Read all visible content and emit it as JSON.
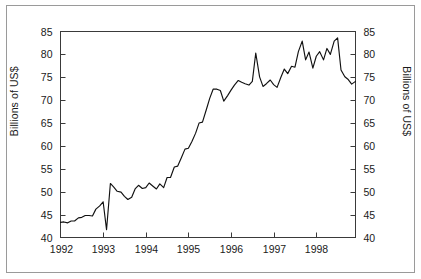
{
  "chart_data": {
    "type": "line",
    "title": "",
    "xlabel": "",
    "ylabel": "Billions of US$",
    "ylabel_right": "Billions of US$",
    "xlim": [
      1992.0,
      1998.92
    ],
    "ylim": [
      40,
      85
    ],
    "yticks": [
      40,
      45,
      50,
      55,
      60,
      65,
      70,
      75,
      80,
      85
    ],
    "xticks": [
      1992,
      1993,
      1994,
      1995,
      1996,
      1997,
      1998
    ],
    "xticklabels": [
      "1992",
      "1993",
      "1994",
      "1995",
      "1996",
      "1997",
      "1998"
    ],
    "yticklabels": [
      "40",
      "45",
      "50",
      "55",
      "60",
      "65",
      "70",
      "75",
      "80",
      "85"
    ],
    "grid": false,
    "legend": null,
    "series": [
      {
        "name": "Reserves",
        "color": "#111111",
        "x": [
          1992.0,
          1992.08,
          1992.17,
          1992.25,
          1992.33,
          1992.42,
          1992.5,
          1992.58,
          1992.67,
          1992.75,
          1992.83,
          1992.92,
          1993.0,
          1993.08,
          1993.17,
          1993.25,
          1993.33,
          1993.42,
          1993.5,
          1993.58,
          1993.67,
          1993.75,
          1993.83,
          1993.92,
          1994.0,
          1994.08,
          1994.17,
          1994.25,
          1994.33,
          1994.42,
          1994.5,
          1994.58,
          1994.67,
          1994.75,
          1994.83,
          1994.92,
          1995.0,
          1995.08,
          1995.17,
          1995.25,
          1995.33,
          1995.42,
          1995.5,
          1995.58,
          1995.67,
          1995.75,
          1995.83,
          1995.92,
          1996.0,
          1996.08,
          1996.17,
          1996.25,
          1996.33,
          1996.42,
          1996.5,
          1996.58,
          1996.67,
          1996.75,
          1996.83,
          1996.92,
          1997.0,
          1997.08,
          1997.17,
          1997.25,
          1997.33,
          1997.42,
          1997.5,
          1997.58,
          1997.67,
          1997.75,
          1997.83,
          1997.92,
          1998.0,
          1998.08,
          1998.17,
          1998.25,
          1998.33,
          1998.42,
          1998.5,
          1998.58,
          1998.67,
          1998.75,
          1998.83,
          1998.92
        ],
        "y": [
          43.3,
          43.4,
          43.2,
          43.6,
          43.6,
          44.3,
          44.4,
          44.8,
          44.8,
          44.7,
          46.2,
          46.9,
          47.8,
          41.7,
          51.8,
          51.0,
          50.1,
          49.9,
          49.0,
          48.3,
          48.8,
          50.6,
          51.4,
          50.7,
          50.9,
          51.9,
          51.2,
          50.6,
          51.7,
          50.9,
          53.1,
          53.1,
          55.4,
          55.6,
          57.3,
          59.3,
          59.5,
          60.9,
          62.8,
          65.0,
          65.2,
          67.9,
          70.4,
          72.4,
          72.4,
          72.1,
          69.8,
          71.0,
          72.2,
          73.3,
          74.3,
          73.9,
          73.6,
          73.3,
          74.1,
          80.3,
          75.1,
          73.0,
          73.6,
          74.4,
          73.4,
          72.8,
          75.0,
          76.8,
          75.8,
          77.4,
          77.2,
          80.6,
          82.9,
          78.8,
          80.5,
          77.0,
          79.6,
          80.6,
          78.8,
          81.3,
          80.0,
          82.9,
          83.6,
          76.6,
          75.1,
          74.5,
          73.5,
          74.1
        ]
      }
    ]
  },
  "axes": {
    "left_title": "Billions of US$",
    "right_title": "Billions of US$"
  }
}
